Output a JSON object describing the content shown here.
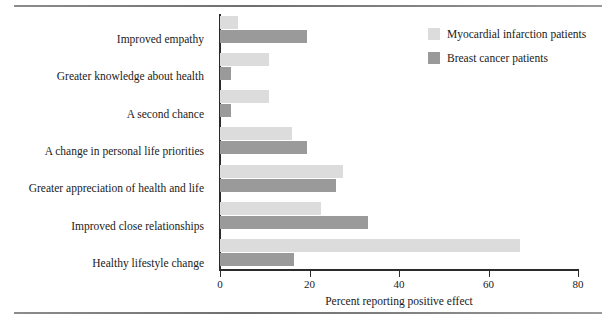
{
  "chart_data": {
    "type": "bar",
    "orientation": "horizontal",
    "title": "",
    "xlabel": "Percent reporting positive effect",
    "ylabel": "",
    "xlim": [
      0,
      80
    ],
    "xticks": [
      0,
      20,
      40,
      60,
      80
    ],
    "grid": false,
    "legend_position": "top-right",
    "categories": [
      "Improved empathy",
      "Greater knowledge about health",
      "A second chance",
      "A change in personal life priorities",
      "Greater appreciation of health and life",
      "Improved close relationships",
      "Healthy lifestyle change"
    ],
    "series": [
      {
        "name": "Myocardial infarction patients",
        "color": "#dcdcdc",
        "values": [
          4,
          11,
          11,
          16,
          27.5,
          22.5,
          67
        ]
      },
      {
        "name": "Breast cancer patients",
        "color": "#9a9a9a",
        "values": [
          19.5,
          2.5,
          2.5,
          19.5,
          26,
          33,
          16.5
        ]
      }
    ]
  },
  "legend": {
    "items": [
      {
        "label": "Myocardial infarction patients",
        "color": "#dcdcdc"
      },
      {
        "label": "Breast cancer patients",
        "color": "#9a9a9a"
      }
    ]
  }
}
